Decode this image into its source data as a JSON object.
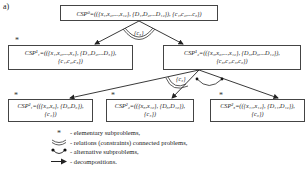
{
  "panel_label": "a)",
  "nodes": {
    "root": {
      "text": "CSP⁰=(({x₁,x₂,...,x₁₂}, {D₁,D₂,...D₁₂}), {c₁,c₂,...c₆})"
    },
    "mid_left": {
      "line1": "CSP¹₁=(({x₁,x₂,...,x₅}, {D₁,D₂,...D₅}),",
      "line2": "{c₁,c₂,c₃})",
      "elementary": true
    },
    "mid_right": {
      "line1": "CSP¹₂=(({x₅,x₆,...,x₁₂}, {D₅,D₆,...D₁₂}),",
      "line2": "{c₃,c₄,c₅,c₆})",
      "elementary": false
    },
    "bottom_1": {
      "line1": "CSP²₁=(({x₅,x₆}, {D₅,D₆}),",
      "line2": "{c₄})",
      "elementary": true
    },
    "bottom_2": {
      "line1": "CSP²₂=(({x₈,x₁₀}, {D₈,D₁₀}),",
      "line2": "{c₅})",
      "elementary": true
    },
    "bottom_3": {
      "line1": "CSP²₃=(({x₁₁,x₁₂}, {D₁₁,D₁₂}),",
      "line2": "{c₆})",
      "elementary": true
    }
  },
  "connection_labels": {
    "top": "{c₃}",
    "mid": "{c₅}"
  },
  "star_symbol": "*",
  "legend": [
    {
      "symbol": "star",
      "text": "- elementary subproblems,"
    },
    {
      "symbol": "relation-arcs",
      "text": "- relations (constraints) connected problems,"
    },
    {
      "symbol": "alternative-arc",
      "text": "- alternative subproblems,"
    },
    {
      "symbol": "arrow",
      "text": "- decompositions."
    }
  ]
}
